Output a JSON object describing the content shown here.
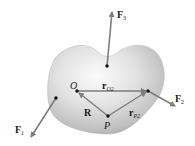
{
  "figure": {
    "colors": {
      "body_light": "#f4f4f4",
      "body_dark": "#a8a8a8",
      "arrow": "#7d7d7d",
      "dot": "#111111",
      "text": "#1a1a1a"
    },
    "labels": {
      "F1": {
        "main": "F",
        "sub": "1"
      },
      "F2": {
        "main": "F",
        "sub": "2"
      },
      "F3": {
        "main": "F",
        "sub": "3"
      },
      "O": "O",
      "P": "P",
      "R": "R",
      "rO2": {
        "main": "r",
        "sub": "O2"
      },
      "rP2": {
        "main": "r",
        "sub": "P2"
      }
    },
    "points": {
      "F3_application": [
        107,
        66
      ],
      "O": [
        77,
        91
      ],
      "F2_application": [
        148,
        91
      ],
      "P": [
        108,
        116
      ],
      "F1_application": [
        56,
        98
      ]
    }
  }
}
